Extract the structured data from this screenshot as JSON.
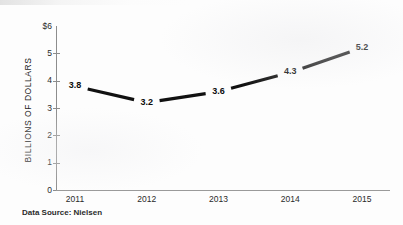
{
  "chart_data": {
    "type": "line",
    "title": "",
    "subtitle": "",
    "xlabel": "",
    "ylabel": "BILLIONS OF DOLLARS",
    "categories": [
      "2011",
      "2012",
      "2013",
      "2014",
      "2015"
    ],
    "values": [
      3.8,
      3.2,
      3.6,
      4.3,
      5.2
    ],
    "point_labels": [
      "3.8",
      "3.2",
      "3.6",
      "4.3",
      "5.2"
    ],
    "series": [
      {
        "name": "Sales",
        "values": [
          3.8,
          3.2,
          3.6,
          4.3,
          5.2
        ],
        "color": "#111111"
      }
    ],
    "ylim": [
      0,
      6
    ],
    "yticks": [
      0,
      1,
      2,
      3,
      4,
      5,
      6
    ],
    "ytick_labels": [
      "0",
      "1",
      "2",
      "3",
      "4",
      "5",
      "$6"
    ],
    "xtick_labels": [
      "2011",
      "2012",
      "2013",
      "2014",
      "2015"
    ],
    "grid": false,
    "legend": false,
    "legend_position": "none",
    "annotations": [
      "Data Source: Nielsen"
    ]
  },
  "axes": {
    "y_title": "BILLIONS OF DOLLARS",
    "y_ticks": [
      {
        "label": "$6",
        "value": 6
      },
      {
        "label": "5",
        "value": 5
      },
      {
        "label": "4",
        "value": 4
      },
      {
        "label": "3",
        "value": 3
      },
      {
        "label": "2",
        "value": 2
      },
      {
        "label": "1",
        "value": 1
      },
      {
        "label": "0",
        "value": 0
      }
    ],
    "x_ticks": [
      {
        "label": "2011"
      },
      {
        "label": "2012"
      },
      {
        "label": "2013"
      },
      {
        "label": "2014"
      },
      {
        "label": "2015"
      }
    ]
  },
  "footer": {
    "source": "Data Source: Nielsen"
  },
  "colors": {
    "line": "#111111",
    "axis": "#8d8d8d",
    "text": "#1e1e1e",
    "background": "#fdfdfd"
  }
}
